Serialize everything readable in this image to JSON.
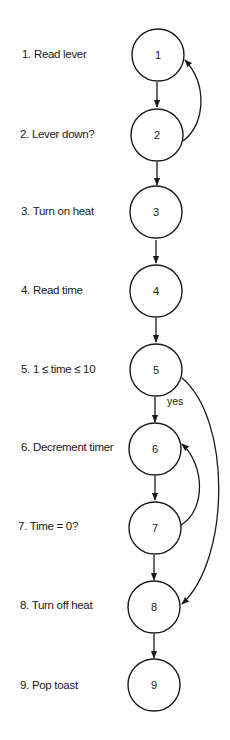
{
  "diagram": {
    "type": "control-flow-graph",
    "colors": {
      "stroke": "#1a1a1a",
      "background": "#ffffff"
    },
    "steps": [
      {
        "id": "1",
        "label": "1. Read lever"
      },
      {
        "id": "2",
        "label": "2. Lever down?"
      },
      {
        "id": "3",
        "label": "3. Turn on heat"
      },
      {
        "id": "4",
        "label": "4. Read time"
      },
      {
        "id": "5",
        "label": "5. 1 ≤ time ≤ 10"
      },
      {
        "id": "6",
        "label": "6. Decrement  timer"
      },
      {
        "id": "7",
        "label": "7. Time = 0?"
      },
      {
        "id": "8",
        "label": "8. Turn off heat"
      },
      {
        "id": "9",
        "label": "9. Pop toast"
      }
    ],
    "edges": [
      {
        "from": "1",
        "to": "2",
        "label": ""
      },
      {
        "from": "2",
        "to": "1",
        "label": ""
      },
      {
        "from": "2",
        "to": "3",
        "label": ""
      },
      {
        "from": "3",
        "to": "4",
        "label": ""
      },
      {
        "from": "4",
        "to": "5",
        "label": ""
      },
      {
        "from": "5",
        "to": "6",
        "label": "yes"
      },
      {
        "from": "5",
        "to": "8",
        "label": ""
      },
      {
        "from": "6",
        "to": "7",
        "label": ""
      },
      {
        "from": "7",
        "to": "6",
        "label": ""
      },
      {
        "from": "7",
        "to": "8",
        "label": ""
      },
      {
        "from": "8",
        "to": "9",
        "label": ""
      }
    ]
  }
}
